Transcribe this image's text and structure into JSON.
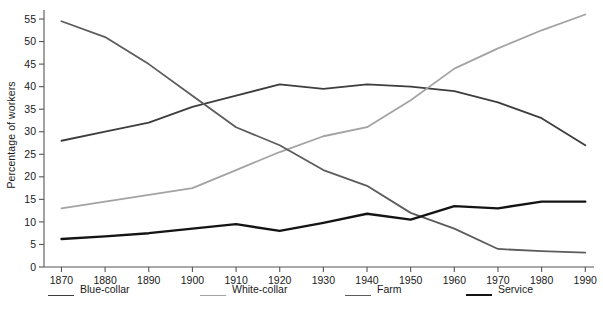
{
  "chart_data": {
    "type": "line",
    "title": "",
    "xlabel": "",
    "ylabel": "Percentage of workers",
    "x": [
      1870,
      1880,
      1890,
      1900,
      1910,
      1920,
      1930,
      1940,
      1950,
      1960,
      1970,
      1980,
      1990
    ],
    "xlim": [
      1866,
      1992
    ],
    "ylim": [
      0,
      57
    ],
    "yticks": [
      0,
      5,
      10,
      15,
      20,
      25,
      30,
      35,
      40,
      45,
      50,
      55
    ],
    "xticks": [
      "1870",
      "1880",
      "1890",
      "1900",
      "1910",
      "1920",
      "1930",
      "1940",
      "1950",
      "1960",
      "1970",
      "1980",
      "1990"
    ],
    "grid": false,
    "legend_position": "bottom",
    "series": [
      {
        "name": "Blue-collar",
        "color": "#3d3d3d",
        "width": 1.8,
        "values": [
          28.0,
          30.0,
          32.0,
          35.5,
          38.0,
          40.5,
          39.5,
          40.5,
          40.0,
          39.0,
          36.5,
          33.0,
          27.0
        ]
      },
      {
        "name": "White-collar",
        "color": "#a3a3a3",
        "width": 1.8,
        "values": [
          13.0,
          14.5,
          16.0,
          17.5,
          21.5,
          25.5,
          29.0,
          31.0,
          37.0,
          44.0,
          48.5,
          52.5,
          56.0
        ]
      },
      {
        "name": "Farm",
        "color": "#5c5c5c",
        "width": 1.8,
        "values": [
          54.5,
          51.0,
          45.0,
          38.0,
          31.0,
          27.0,
          21.5,
          18.0,
          12.0,
          8.5,
          4.0,
          3.5,
          3.2
        ]
      },
      {
        "name": "Service",
        "color": "#141414",
        "width": 2.4,
        "values": [
          6.2,
          6.8,
          7.5,
          8.5,
          9.5,
          8.0,
          9.8,
          11.8,
          10.5,
          13.5,
          13.0,
          14.5,
          14.5
        ]
      }
    ]
  },
  "legend": {
    "items": [
      {
        "label": "Blue-collar",
        "color": "#3d3d3d",
        "width": 1.8
      },
      {
        "label": "White-collar",
        "color": "#a3a3a3",
        "width": 1.8
      },
      {
        "label": "Farm",
        "color": "#5c5c5c",
        "width": 1.8
      },
      {
        "label": "Service",
        "color": "#141414",
        "width": 2.4
      }
    ]
  },
  "axis": {
    "color": "#555555",
    "tick_color": "#555555",
    "label_color": "#1a1a1a"
  }
}
